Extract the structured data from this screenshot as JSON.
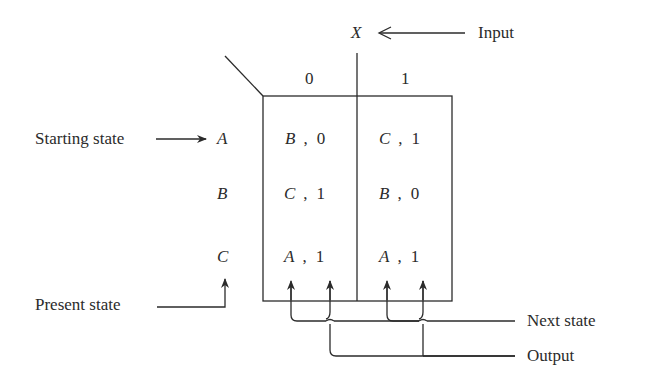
{
  "diagram": {
    "type": "state-table",
    "input": {
      "variable": "X",
      "label": "Input",
      "columns": [
        "0",
        "1"
      ]
    },
    "labels": {
      "starting_state": "Starting state",
      "present_state": "Present state",
      "next_state": "Next state",
      "output": "Output"
    },
    "rows": [
      {
        "state": "A",
        "cells": [
          {
            "next": "B",
            "sep": ",",
            "out": "0"
          },
          {
            "next": "C",
            "sep": ",",
            "out": "1"
          }
        ]
      },
      {
        "state": "B",
        "cells": [
          {
            "next": "C",
            "sep": ",",
            "out": "1"
          },
          {
            "next": "B",
            "sep": ",",
            "out": "0"
          }
        ]
      },
      {
        "state": "C",
        "cells": [
          {
            "next": "A",
            "sep": ",",
            "out": "1"
          },
          {
            "next": "A",
            "sep": ",",
            "out": "1"
          }
        ]
      }
    ],
    "stroke_color": "#2b2b2b"
  }
}
